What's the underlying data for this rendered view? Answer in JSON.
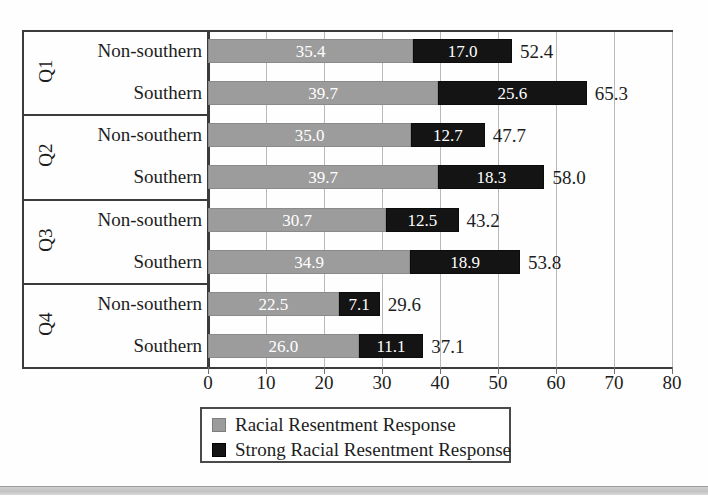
{
  "chart_data": {
    "type": "bar",
    "orientation": "horizontal",
    "stacked": true,
    "title": "",
    "xlabel": "",
    "ylabel": "",
    "xlim": [
      0,
      80
    ],
    "xticks": [
      0,
      10,
      20,
      30,
      40,
      50,
      60,
      70,
      80
    ],
    "grid": true,
    "legend_position": "bottom",
    "legend": [
      {
        "label": "Racial Resentment Response",
        "color": "#9c9c9c"
      },
      {
        "label": "Strong Racial Resentment Response",
        "color": "#141414"
      }
    ],
    "series": [
      {
        "name": "Racial Resentment Response",
        "color": "#9c9c9c",
        "values": [
          35.4,
          39.7,
          35.0,
          39.7,
          30.7,
          34.9,
          22.5,
          26.0
        ]
      },
      {
        "name": "Strong Racial Resentment Response",
        "color": "#141414",
        "values": [
          17.0,
          25.6,
          12.7,
          18.3,
          12.5,
          18.9,
          7.1,
          11.1
        ]
      }
    ],
    "groups": [
      {
        "label": "Q1",
        "rows": [
          "Non-southern",
          "Southern"
        ]
      },
      {
        "label": "Q2",
        "rows": [
          "Non-southern",
          "Southern"
        ]
      },
      {
        "label": "Q3",
        "rows": [
          "Non-southern",
          "Southern"
        ]
      },
      {
        "label": "Q4",
        "rows": [
          "Non-southern",
          "Southern"
        ]
      }
    ],
    "categories": [
      "Q1 Non-southern",
      "Q1 Southern",
      "Q2 Non-southern",
      "Q2 Southern",
      "Q3 Non-southern",
      "Q3 Southern",
      "Q4 Non-southern",
      "Q4 Southern"
    ],
    "totals": [
      52.4,
      65.3,
      47.7,
      58.0,
      43.2,
      53.8,
      29.6,
      37.1
    ],
    "bars": [
      {
        "group": "Q1",
        "row": "Non-southern",
        "light": "35.4",
        "dark": "17.0",
        "total": "52.4"
      },
      {
        "group": "Q1",
        "row": "Southern",
        "light": "39.7",
        "dark": "25.6",
        "total": "65.3"
      },
      {
        "group": "Q2",
        "row": "Non-southern",
        "light": "35.0",
        "dark": "12.7",
        "total": "47.7"
      },
      {
        "group": "Q2",
        "row": "Southern",
        "light": "39.7",
        "dark": "18.3",
        "total": "58.0"
      },
      {
        "group": "Q3",
        "row": "Non-southern",
        "light": "30.7",
        "dark": "12.5",
        "total": "43.2"
      },
      {
        "group": "Q3",
        "row": "Southern",
        "light": "34.9",
        "dark": "18.9",
        "total": "53.8"
      },
      {
        "group": "Q4",
        "row": "Non-southern",
        "light": "22.5",
        "dark": "7.1",
        "total": "29.6"
      },
      {
        "group": "Q4",
        "row": "Southern",
        "light": "26.0",
        "dark": "11.1",
        "total": "37.1"
      }
    ]
  },
  "axis": {
    "ticks": [
      "0",
      "10",
      "20",
      "30",
      "40",
      "50",
      "60",
      "70",
      "80"
    ]
  },
  "groups": [
    {
      "label": "Q1"
    },
    {
      "label": "Q2"
    },
    {
      "label": "Q3"
    },
    {
      "label": "Q4"
    }
  ],
  "rows": [
    {
      "label": "Non-southern"
    },
    {
      "label": "Southern"
    },
    {
      "label": "Non-southern"
    },
    {
      "label": "Southern"
    },
    {
      "label": "Non-southern"
    },
    {
      "label": "Southern"
    },
    {
      "label": "Non-southern"
    },
    {
      "label": "Southern"
    }
  ],
  "legend": {
    "items": [
      {
        "label": "Racial Resentment Response"
      },
      {
        "label": "Strong Racial Resentment Response"
      }
    ]
  }
}
